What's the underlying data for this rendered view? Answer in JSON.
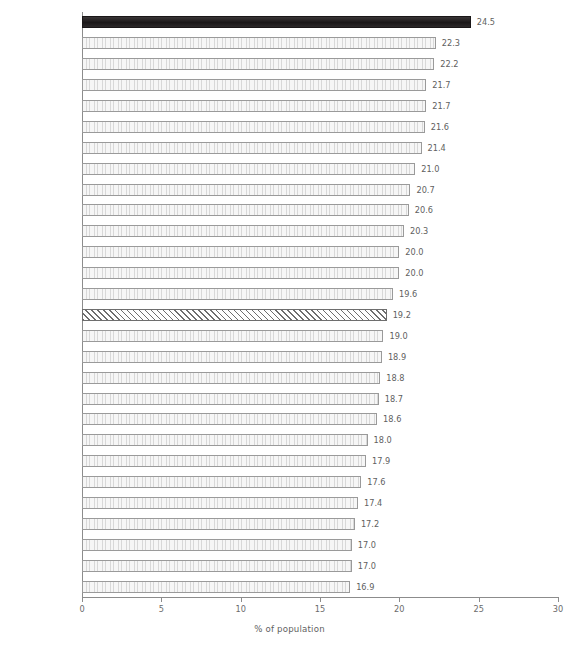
{
  "chart_data": {
    "type": "bar",
    "orientation": "horizontal",
    "title": "",
    "subtitle": "",
    "xlabel": "% of population",
    "ylabel": "",
    "xlim": [
      0,
      30
    ],
    "xticks": [
      0,
      5,
      10,
      15,
      20,
      25,
      30
    ],
    "xtick_labels": [
      "0",
      "5",
      "10",
      "15",
      "20",
      "25",
      "30"
    ],
    "grid": false,
    "legend": "none",
    "categories": [
      "Ireland",
      "France",
      "Denmark",
      "Luxembourg",
      "Cyprus",
      "Netherlands",
      "United Kingdom",
      "Sweden",
      "Finland",
      "Belgium",
      "Malta",
      "Lithuania",
      "Slovakia",
      "Poland",
      "EU-27",
      "Austria",
      "Romania",
      "Estonia",
      "Hungary",
      "Portugal",
      "Latvia",
      "Czech Republic",
      "Spain",
      "Greece",
      "Slovenia",
      "Italy",
      "Germany",
      "Bulgaria"
    ],
    "values": [
      24.5,
      22.3,
      22.2,
      21.7,
      21.7,
      21.6,
      21.4,
      21.0,
      20.7,
      20.6,
      20.3,
      20.0,
      20.0,
      19.6,
      19.2,
      19.0,
      18.9,
      18.8,
      18.7,
      18.6,
      18.0,
      17.9,
      17.6,
      17.4,
      17.2,
      17.0,
      17.0,
      16.9
    ],
    "value_labels": [
      "24.5",
      "22.3",
      "22.2",
      "21.7",
      "21.7",
      "21.6",
      "21.4",
      "21.0",
      "20.7",
      "20.6",
      "20.3",
      "20.0",
      "20.0",
      "19.6",
      "19.2",
      "19.0",
      "18.9",
      "18.8",
      "18.7",
      "18.6",
      "18.0",
      "17.9",
      "17.6",
      "17.4",
      "17.2",
      "17.0",
      "17.0",
      "16.9"
    ],
    "bar_styles": [
      "highlight",
      "stipple",
      "stipple",
      "stipple",
      "stipple",
      "stipple",
      "stipple",
      "stipple",
      "stipple",
      "stipple",
      "stipple",
      "stipple",
      "stipple",
      "stipple",
      "hatched",
      "stipple",
      "stipple",
      "stipple",
      "stipple",
      "stipple",
      "stipple",
      "stipple",
      "stipple",
      "stipple",
      "stipple",
      "stipple",
      "stipple",
      "stipple"
    ],
    "colors": {
      "highlight_bar": "#231f20",
      "stipple_bar_fill": "#f2f2f2",
      "stipple_bar_border": "#9a9a9a",
      "hatched_bar_line": "#6e6e6e",
      "axis_line": "#8c8c8c",
      "text": "#5f5f5f",
      "background": "#ffffff"
    }
  }
}
